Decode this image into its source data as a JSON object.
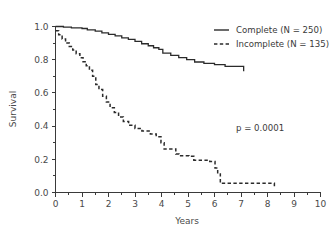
{
  "chart_data": {
    "type": "line",
    "title": "",
    "subtitle": "",
    "xlabel": "Years",
    "ylabel": "Survival",
    "xlim": [
      0,
      10
    ],
    "ylim": [
      0.0,
      1.0
    ],
    "grid": false,
    "legend_position": "top-right",
    "xticks": [
      0,
      1,
      2,
      3,
      4,
      5,
      6,
      7,
      8,
      9,
      10
    ],
    "xtick_labels": [
      "0",
      "1",
      "2",
      "3",
      "4",
      "5",
      "6",
      "7",
      "8",
      "9",
      "10"
    ],
    "xminor_step": 0.5,
    "yticks": [
      0.0,
      0.2,
      0.4,
      0.6,
      0.8,
      1.0
    ],
    "ytick_labels": [
      "0.0",
      "0.2",
      "0.4",
      "0.6",
      "0.8",
      "1.0"
    ],
    "yminor_step": 0.1,
    "annotations": [
      {
        "text": "p = 0.0001",
        "x": 6.5,
        "y": 0.37
      }
    ],
    "series": [
      {
        "name": "Complete (N = 250)",
        "legend_label": "Complete (N = 250)",
        "style": "solid",
        "n": 250,
        "color": "#2b2b2b",
        "points": [
          [
            0.0,
            1.0
          ],
          [
            0.25,
            1.0
          ],
          [
            0.3,
            0.996
          ],
          [
            0.55,
            0.996
          ],
          [
            0.6,
            0.992
          ],
          [
            0.95,
            0.992
          ],
          [
            1.0,
            0.988
          ],
          [
            1.15,
            0.988
          ],
          [
            1.2,
            0.98
          ],
          [
            1.45,
            0.98
          ],
          [
            1.5,
            0.972
          ],
          [
            1.7,
            0.972
          ],
          [
            1.75,
            0.962
          ],
          [
            1.95,
            0.962
          ],
          [
            2.0,
            0.952
          ],
          [
            2.2,
            0.952
          ],
          [
            2.25,
            0.944
          ],
          [
            2.45,
            0.944
          ],
          [
            2.5,
            0.932
          ],
          [
            2.7,
            0.932
          ],
          [
            2.75,
            0.922
          ],
          [
            2.95,
            0.922
          ],
          [
            3.0,
            0.91
          ],
          [
            3.2,
            0.91
          ],
          [
            3.25,
            0.896
          ],
          [
            3.45,
            0.896
          ],
          [
            3.5,
            0.884
          ],
          [
            3.65,
            0.884
          ],
          [
            3.7,
            0.872
          ],
          [
            3.85,
            0.872
          ],
          [
            3.9,
            0.862
          ],
          [
            4.0,
            0.862
          ],
          [
            4.05,
            0.84
          ],
          [
            4.3,
            0.84
          ],
          [
            4.35,
            0.826
          ],
          [
            4.6,
            0.826
          ],
          [
            4.65,
            0.812
          ],
          [
            4.9,
            0.812
          ],
          [
            4.95,
            0.8
          ],
          [
            5.2,
            0.8
          ],
          [
            5.25,
            0.786
          ],
          [
            5.55,
            0.786
          ],
          [
            5.6,
            0.778
          ],
          [
            5.95,
            0.778
          ],
          [
            6.0,
            0.77
          ],
          [
            6.35,
            0.77
          ],
          [
            6.4,
            0.76
          ],
          [
            7.05,
            0.76
          ],
          [
            7.1,
            0.73
          ]
        ]
      },
      {
        "name": "Incomplete (N = 135)",
        "legend_label": "Incomplete (N = 135)",
        "style": "dashed",
        "n": 135,
        "color": "#2b2b2b",
        "points": [
          [
            0.0,
            0.975
          ],
          [
            0.1,
            0.975
          ],
          [
            0.12,
            0.95
          ],
          [
            0.22,
            0.95
          ],
          [
            0.25,
            0.925
          ],
          [
            0.35,
            0.925
          ],
          [
            0.38,
            0.9
          ],
          [
            0.48,
            0.9
          ],
          [
            0.52,
            0.88
          ],
          [
            0.62,
            0.88
          ],
          [
            0.65,
            0.858
          ],
          [
            0.75,
            0.858
          ],
          [
            0.78,
            0.836
          ],
          [
            0.88,
            0.836
          ],
          [
            0.92,
            0.812
          ],
          [
            1.0,
            0.812
          ],
          [
            1.04,
            0.788
          ],
          [
            1.12,
            0.788
          ],
          [
            1.16,
            0.764
          ],
          [
            1.24,
            0.764
          ],
          [
            1.28,
            0.736
          ],
          [
            1.36,
            0.736
          ],
          [
            1.4,
            0.7
          ],
          [
            1.48,
            0.7
          ],
          [
            1.52,
            0.65
          ],
          [
            1.6,
            0.65
          ],
          [
            1.64,
            0.62
          ],
          [
            1.74,
            0.62
          ],
          [
            1.78,
            0.58
          ],
          [
            1.88,
            0.58
          ],
          [
            1.92,
            0.545
          ],
          [
            2.02,
            0.545
          ],
          [
            2.06,
            0.51
          ],
          [
            2.18,
            0.51
          ],
          [
            2.22,
            0.482
          ],
          [
            2.34,
            0.482
          ],
          [
            2.38,
            0.455
          ],
          [
            2.52,
            0.455
          ],
          [
            2.56,
            0.428
          ],
          [
            2.72,
            0.428
          ],
          [
            2.76,
            0.405
          ],
          [
            2.96,
            0.405
          ],
          [
            3.0,
            0.386
          ],
          [
            3.22,
            0.386
          ],
          [
            3.26,
            0.37
          ],
          [
            3.54,
            0.37
          ],
          [
            3.58,
            0.352
          ],
          [
            3.76,
            0.352
          ],
          [
            3.8,
            0.336
          ],
          [
            3.94,
            0.336
          ],
          [
            3.98,
            0.3
          ],
          [
            4.06,
            0.3
          ],
          [
            4.1,
            0.262
          ],
          [
            4.5,
            0.262
          ],
          [
            4.54,
            0.232
          ],
          [
            4.62,
            0.232
          ],
          [
            4.66,
            0.222
          ],
          [
            5.0,
            0.222
          ],
          [
            5.04,
            0.218
          ],
          [
            5.18,
            0.218
          ],
          [
            5.22,
            0.195
          ],
          [
            5.78,
            0.195
          ],
          [
            5.82,
            0.186
          ],
          [
            5.98,
            0.186
          ],
          [
            6.02,
            0.148
          ],
          [
            6.08,
            0.148
          ],
          [
            6.12,
            0.112
          ],
          [
            6.18,
            0.112
          ],
          [
            6.22,
            0.055
          ],
          [
            8.22,
            0.055
          ],
          [
            8.26,
            0.035
          ]
        ]
      }
    ]
  },
  "legend": {
    "items": [
      {
        "label": "Complete (N = 250)",
        "style": "solid"
      },
      {
        "label": "Incomplete (N = 135)",
        "style": "dashed"
      }
    ]
  },
  "annotation": {
    "pvalue": "p = 0.0001"
  },
  "axes": {
    "x_title": "Years",
    "y_title": "Survival"
  }
}
